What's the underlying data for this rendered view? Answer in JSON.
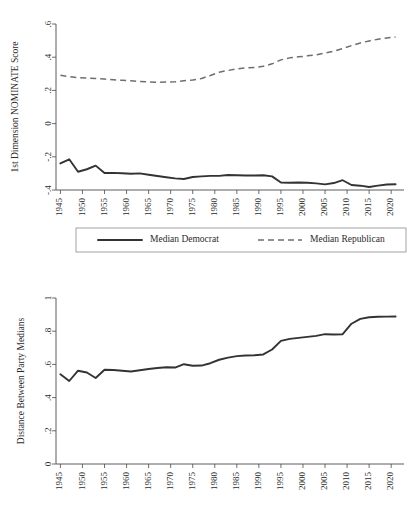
{
  "chart_data": [
    {
      "type": "line",
      "title": "",
      "xlabel": "",
      "ylabel": "1st Dimension NOMINATE Score",
      "xlim": [
        1944,
        2022
      ],
      "ylim": [
        -0.4,
        0.6
      ],
      "xticks": [
        1945,
        1950,
        1955,
        1960,
        1965,
        1970,
        1975,
        1980,
        1985,
        1990,
        1995,
        2000,
        2005,
        2010,
        2015,
        2020
      ],
      "yticks": [
        -0.4,
        -0.2,
        0,
        0.2,
        0.4,
        0.6
      ],
      "ytick_labels": [
        "-.4",
        "-.2",
        "0",
        ".2",
        ".4",
        ".6"
      ],
      "grid": false,
      "legend_position": "below",
      "x": [
        1945,
        1947,
        1949,
        1951,
        1953,
        1955,
        1957,
        1959,
        1961,
        1963,
        1965,
        1967,
        1969,
        1971,
        1973,
        1975,
        1977,
        1979,
        1981,
        1983,
        1985,
        1987,
        1989,
        1991,
        1993,
        1995,
        1997,
        1999,
        2001,
        2003,
        2005,
        2007,
        2009,
        2011,
        2013,
        2015,
        2017,
        2019,
        2021
      ],
      "series": [
        {
          "name": "Median Democrat",
          "style": "solid",
          "color": "#333333",
          "values": [
            -0.24,
            -0.215,
            -0.29,
            -0.275,
            -0.253,
            -0.298,
            -0.297,
            -0.299,
            -0.302,
            -0.3,
            -0.308,
            -0.316,
            -0.323,
            -0.33,
            -0.334,
            -0.322,
            -0.318,
            -0.315,
            -0.315,
            -0.31,
            -0.311,
            -0.313,
            -0.313,
            -0.311,
            -0.318,
            -0.355,
            -0.356,
            -0.355,
            -0.356,
            -0.36,
            -0.366,
            -0.358,
            -0.341,
            -0.37,
            -0.374,
            -0.382,
            -0.374,
            -0.367,
            -0.365
          ]
        },
        {
          "name": "Median Republican",
          "style": "dashed",
          "color": "#6e6e6e",
          "values": [
            0.291,
            0.283,
            0.277,
            0.274,
            0.272,
            0.268,
            0.264,
            0.261,
            0.258,
            0.254,
            0.251,
            0.249,
            0.25,
            0.252,
            0.258,
            0.262,
            0.272,
            0.29,
            0.31,
            0.32,
            0.33,
            0.336,
            0.338,
            0.345,
            0.36,
            0.384,
            0.396,
            0.402,
            0.408,
            0.414,
            0.425,
            0.436,
            0.452,
            0.47,
            0.486,
            0.498,
            0.508,
            0.516,
            0.521
          ]
        }
      ]
    },
    {
      "type": "line",
      "title": "",
      "xlabel": "",
      "ylabel": "Distance Between Party Medians",
      "xlim": [
        1944,
        2022
      ],
      "ylim": [
        0,
        1
      ],
      "xticks": [
        1945,
        1950,
        1955,
        1960,
        1965,
        1970,
        1975,
        1980,
        1985,
        1990,
        1995,
        2000,
        2005,
        2010,
        2015,
        2020
      ],
      "yticks": [
        0,
        0.2,
        0.4,
        0.6,
        0.8,
        1
      ],
      "ytick_labels": [
        "0",
        ".2",
        ".4",
        ".6",
        ".8",
        "1"
      ],
      "grid": false,
      "legend_position": "none",
      "x": [
        1945,
        1947,
        1949,
        1951,
        1953,
        1955,
        1957,
        1959,
        1961,
        1963,
        1965,
        1967,
        1969,
        1971,
        1973,
        1975,
        1977,
        1979,
        1981,
        1983,
        1985,
        1987,
        1989,
        1991,
        1993,
        1995,
        1997,
        1999,
        2001,
        2003,
        2005,
        2007,
        2009,
        2011,
        2013,
        2015,
        2017,
        2019,
        2021
      ],
      "series": [
        {
          "name": "Distance Between Party Medians",
          "style": "solid",
          "color": "#333333",
          "values": [
            0.54,
            0.5,
            0.562,
            0.551,
            0.518,
            0.568,
            0.566,
            0.562,
            0.557,
            0.565,
            0.572,
            0.578,
            0.583,
            0.581,
            0.601,
            0.592,
            0.593,
            0.607,
            0.628,
            0.641,
            0.65,
            0.654,
            0.655,
            0.66,
            0.69,
            0.742,
            0.754,
            0.76,
            0.766,
            0.772,
            0.782,
            0.78,
            0.782,
            0.845,
            0.874,
            0.884,
            0.887,
            0.888,
            0.889
          ]
        }
      ]
    }
  ],
  "legend": {
    "items": [
      {
        "label": "Median Democrat",
        "style": "solid"
      },
      {
        "label": "Median Republican",
        "style": "dashed"
      }
    ]
  }
}
